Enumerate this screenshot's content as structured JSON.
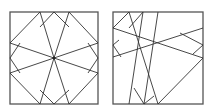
{
  "figure": {
    "stroke_color": "#333333",
    "frame_color": "#555555",
    "background": "#ffffff"
  },
  "left_square": {
    "frame": [
      10,
      12,
      88,
      92
    ],
    "lines": [
      [
        40,
        12,
        54,
        58
      ],
      [
        54,
        12,
        54,
        12
      ],
      [
        69,
        12,
        54,
        58
      ],
      [
        40,
        12,
        10,
        43
      ],
      [
        69,
        12,
        98,
        43
      ],
      [
        54,
        12,
        40,
        27
      ],
      [
        54,
        12,
        69,
        27
      ],
      [
        10,
        43,
        54,
        58
      ],
      [
        98,
        43,
        54,
        58
      ],
      [
        10,
        73,
        54,
        58
      ],
      [
        98,
        73,
        54,
        58
      ],
      [
        10,
        58,
        20,
        43
      ],
      [
        10,
        58,
        20,
        73
      ],
      [
        98,
        58,
        88,
        43
      ],
      [
        98,
        58,
        88,
        73
      ],
      [
        10,
        73,
        40,
        104
      ],
      [
        98,
        73,
        69,
        104
      ],
      [
        40,
        104,
        54,
        58
      ],
      [
        69,
        104,
        54,
        58
      ],
      [
        54,
        104,
        40,
        90
      ],
      [
        54,
        104,
        69,
        90
      ]
    ]
  },
  "right_square": {
    "frame": [
      113,
      12,
      90,
      92
    ],
    "lines": [
      [
        129,
        12,
        113,
        28
      ],
      [
        143,
        12,
        129,
        28
      ],
      [
        158,
        12,
        144,
        104
      ],
      [
        129,
        12,
        158,
        104
      ],
      [
        143,
        12,
        129,
        104
      ],
      [
        113,
        28,
        203,
        58
      ],
      [
        113,
        57,
        203,
        28
      ],
      [
        113,
        45,
        119,
        40
      ],
      [
        113,
        45,
        121,
        57
      ],
      [
        203,
        45,
        193,
        54
      ],
      [
        180,
        33,
        203,
        45
      ],
      [
        129,
        28,
        129,
        28
      ],
      [
        113,
        57,
        113,
        57
      ],
      [
        158,
        104,
        203,
        58
      ],
      [
        134,
        88,
        144,
        104
      ],
      [
        144,
        104,
        154,
        96
      ]
    ]
  }
}
